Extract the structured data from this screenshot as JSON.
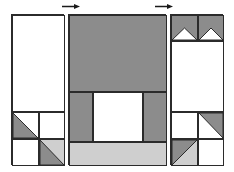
{
  "diagram": {
    "type": "quilt-block-schematic",
    "canvas": {
      "width": 234,
      "height": 172,
      "background": "#ffffff"
    }
  },
  "colors": {
    "background": "#ffffff",
    "outline": "#2b2b2b",
    "fill_white": "#ffffff",
    "fill_mid_gray": "#8c8c8c",
    "fill_light_gray": "#cfcfcf",
    "marker": "#1a1a1a"
  },
  "markers": [
    {
      "name": "top-left-arrow",
      "label": "arrow-right-marker",
      "x": 62,
      "y": 4,
      "width": 18,
      "height": 5,
      "direction": "right",
      "color": "#1a1a1a"
    },
    {
      "name": "top-right-arrow",
      "label": "arrow-right-marker",
      "x": 155,
      "y": 4,
      "width": 18,
      "height": 5,
      "direction": "right",
      "color": "#1a1a1a"
    }
  ],
  "panels": [
    {
      "id": "left-panel",
      "label": "Left Panel",
      "x": 11,
      "y": 14,
      "width": 53,
      "height": 151,
      "cells": [
        {
          "id": "left-top-large",
          "label": "plain white rectangle",
          "x": 0,
          "y": 0,
          "width": 53,
          "height": 97,
          "fill": "#ffffff",
          "shape": "solid"
        },
        {
          "id": "left-mid-left",
          "label": "half-square triangle lower-left",
          "x": 0,
          "y": 97,
          "width": 27,
          "height": 27,
          "fill": "#ffffff",
          "shape": "triangle",
          "triangle_fill": "#8c8c8c",
          "triangle_corner": "bottom-left"
        },
        {
          "id": "left-mid-right",
          "label": "plain white square",
          "x": 27,
          "y": 97,
          "width": 26,
          "height": 27,
          "fill": "#ffffff",
          "shape": "solid"
        },
        {
          "id": "left-bot-left",
          "label": "plain white square",
          "x": 0,
          "y": 124,
          "width": 27,
          "height": 27,
          "fill": "#ffffff",
          "shape": "solid"
        },
        {
          "id": "left-bot-right",
          "label": "half-square triangle lower-left shaded",
          "x": 27,
          "y": 124,
          "width": 26,
          "height": 27,
          "fill": "#cfcfcf",
          "shape": "triangle",
          "triangle_fill": "#8c8c8c",
          "triangle_corner": "bottom-left"
        }
      ]
    },
    {
      "id": "center-panel",
      "label": "Center Panel",
      "x": 68,
      "y": 14,
      "width": 98,
      "height": 151,
      "cells": [
        {
          "id": "center-top-field",
          "label": "large gray field",
          "x": 0,
          "y": 0,
          "width": 98,
          "height": 77,
          "fill": "#8c8c8c",
          "shape": "solid"
        },
        {
          "id": "center-left-post",
          "label": "left gray post",
          "x": 0,
          "y": 77,
          "width": 24,
          "height": 50,
          "fill": "#8c8c8c",
          "shape": "solid"
        },
        {
          "id": "center-window",
          "label": "white center window",
          "x": 24,
          "y": 77,
          "width": 50,
          "height": 50,
          "fill": "#ffffff",
          "shape": "solid"
        },
        {
          "id": "center-right-post",
          "label": "right gray post",
          "x": 74,
          "y": 77,
          "width": 24,
          "height": 50,
          "fill": "#8c8c8c",
          "shape": "solid"
        },
        {
          "id": "center-base-bar",
          "label": "light gray base bar",
          "x": 0,
          "y": 127,
          "width": 98,
          "height": 24,
          "fill": "#cfcfcf",
          "shape": "solid"
        }
      ]
    },
    {
      "id": "right-panel",
      "label": "Right Panel",
      "x": 170,
      "y": 14,
      "width": 53,
      "height": 151,
      "cells": [
        {
          "id": "right-top-left-chevron",
          "label": "flying-geese chevron left",
          "x": 0,
          "y": 0,
          "width": 27,
          "height": 26,
          "fill": "#8c8c8c",
          "shape": "chevron-down",
          "notch_fill": "#ffffff"
        },
        {
          "id": "right-top-right-chevron",
          "label": "flying-geese chevron right",
          "x": 27,
          "y": 0,
          "width": 26,
          "height": 26,
          "fill": "#8c8c8c",
          "shape": "chevron-down",
          "notch_fill": "#ffffff"
        },
        {
          "id": "right-mid-large",
          "label": "plain white rectangle",
          "x": 0,
          "y": 26,
          "width": 53,
          "height": 71,
          "fill": "#ffffff",
          "shape": "solid"
        },
        {
          "id": "right-mid-left",
          "label": "plain white square",
          "x": 0,
          "y": 97,
          "width": 27,
          "height": 27,
          "fill": "#ffffff",
          "shape": "solid"
        },
        {
          "id": "right-mid-right",
          "label": "half-square triangle upper-right",
          "x": 27,
          "y": 97,
          "width": 26,
          "height": 27,
          "fill": "#ffffff",
          "shape": "triangle",
          "triangle_fill": "#8c8c8c",
          "triangle_corner": "top-right"
        },
        {
          "id": "right-bot-left",
          "label": "half-square triangle upper-left shaded",
          "x": 0,
          "y": 124,
          "width": 27,
          "height": 27,
          "fill": "#cfcfcf",
          "shape": "triangle",
          "triangle_fill": "#8c8c8c",
          "triangle_corner": "top-left"
        },
        {
          "id": "right-bot-right",
          "label": "plain white square",
          "x": 27,
          "y": 124,
          "width": 26,
          "height": 27,
          "fill": "#ffffff",
          "shape": "solid"
        }
      ]
    }
  ]
}
